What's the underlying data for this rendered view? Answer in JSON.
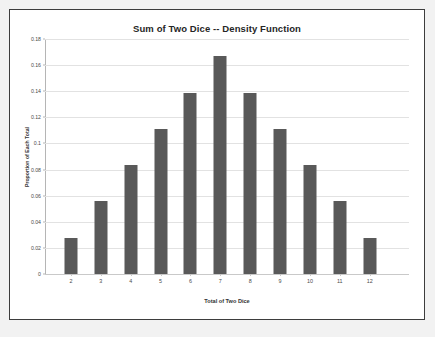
{
  "chart_data": {
    "type": "bar",
    "title": "Sum of Two Dice -- Density Function",
    "xlabel": "Total of Two Dice",
    "ylabel": "Proportion of Each Total",
    "categories": [
      "2",
      "3",
      "4",
      "5",
      "6",
      "7",
      "8",
      "9",
      "10",
      "11",
      "12"
    ],
    "values": [
      0.0278,
      0.0556,
      0.0833,
      0.1111,
      0.1389,
      0.1667,
      0.1389,
      0.1111,
      0.0833,
      0.0556,
      0.0278
    ],
    "ylim": [
      0,
      0.18
    ],
    "ytick_labels": [
      "0",
      "0.02",
      "0.04",
      "0.06",
      "0.08",
      "0.1",
      "0.12",
      "0.14",
      "0.16",
      "0.18"
    ],
    "ytick_values": [
      0,
      0.02,
      0.04,
      0.06,
      0.08,
      0.1,
      0.12,
      0.14,
      0.16,
      0.18
    ],
    "grid": true,
    "legend": false,
    "bar_color": "#595959",
    "gridline_color": "#e2e2e2",
    "axis_color": "#b5b5b5",
    "plot_background": "#ffffff",
    "frame_border_color": "#3d3d3d",
    "page_background": "#f2f2f2"
  }
}
